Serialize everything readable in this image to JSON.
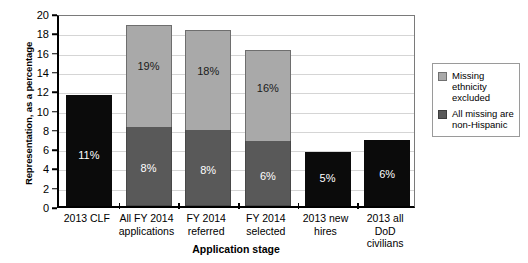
{
  "chart_data": {
    "type": "bar",
    "title": "",
    "xlabel": "Application stage",
    "ylabel": "Representation, as a percentage",
    "ylim": [
      0,
      20
    ],
    "ytick_step": 2,
    "yticks": [
      "0",
      "2",
      "4",
      "6",
      "8",
      "10",
      "12",
      "14",
      "16",
      "18",
      "20"
    ],
    "grid": true,
    "legend_position": "right",
    "categories": [
      "2013 CLF",
      "All FY 2014 applications",
      "FY 2014 referred",
      "FY 2014 selected",
      "2013 new hires",
      "2013 all DoD civilians"
    ],
    "category_lines": [
      [
        "2013 CLF"
      ],
      [
        "All FY 2014",
        "applications"
      ],
      [
        "FY 2014",
        "referred"
      ],
      [
        "FY 2014",
        "selected"
      ],
      [
        "2013 new",
        "hires"
      ],
      [
        "2013 all",
        "DoD civilians"
      ]
    ],
    "series": [
      {
        "name": "All missing are non-Hispanic",
        "color": "#595959",
        "values": [
          null,
          8.2,
          7.9,
          6.7,
          null,
          null
        ],
        "labels": [
          "",
          "8%",
          "8%",
          "6%",
          "",
          ""
        ]
      },
      {
        "name": "Missing ethnicity excluded",
        "color": "#a9a9a9",
        "values": [
          null,
          10.6,
          10.3,
          9.5,
          null,
          null
        ],
        "labels": [
          "",
          "19%",
          "18%",
          "16%",
          "",
          ""
        ]
      },
      {
        "name": "Single value",
        "color": "#0b0b0b",
        "values": [
          11.5,
          null,
          null,
          null,
          5.6,
          6.8
        ],
        "labels": [
          "11%",
          "",
          "",
          "",
          "5%",
          "6%"
        ]
      }
    ],
    "bar_totals": [
      11.5,
      18.8,
      18.2,
      16.2,
      5.6,
      6.8
    ]
  },
  "legend": {
    "items": [
      {
        "swatch": "light",
        "label": "Missing ethnicity excluded"
      },
      {
        "swatch": "dark",
        "label": "All missing are non-Hispanic"
      }
    ]
  }
}
